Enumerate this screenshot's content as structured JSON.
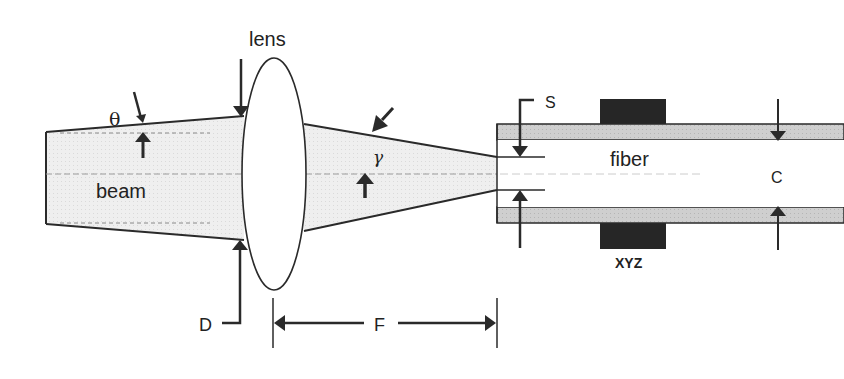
{
  "diagram": {
    "type": "optical-fiber-coupling-schematic",
    "labels": {
      "lens": "lens",
      "theta": "θ",
      "beam": "beam",
      "gamma": "γ",
      "D": "D",
      "F": "F",
      "S": "S",
      "fiber": "fiber",
      "C": "C",
      "xyz": "XYZ"
    },
    "colors": {
      "line": "#2a2a2a",
      "beam_fill": "#ececec",
      "cladding_fill": "#c8c8c8",
      "mount_fill": "#262626",
      "background": "#ffffff"
    },
    "components": [
      {
        "id": "beam",
        "description": "diverging collimated input beam with divergence angle θ"
      },
      {
        "id": "lens",
        "description": "focusing lens of aperture D"
      },
      {
        "id": "cone",
        "description": "converging beam with cone angle γ"
      },
      {
        "id": "fiber",
        "description": "optical fiber with core size C and spot size S"
      },
      {
        "id": "xyz",
        "description": "XYZ positioning mount on fiber"
      },
      {
        "id": "focal-length",
        "description": "focal length F from lens to fiber face"
      }
    ]
  }
}
